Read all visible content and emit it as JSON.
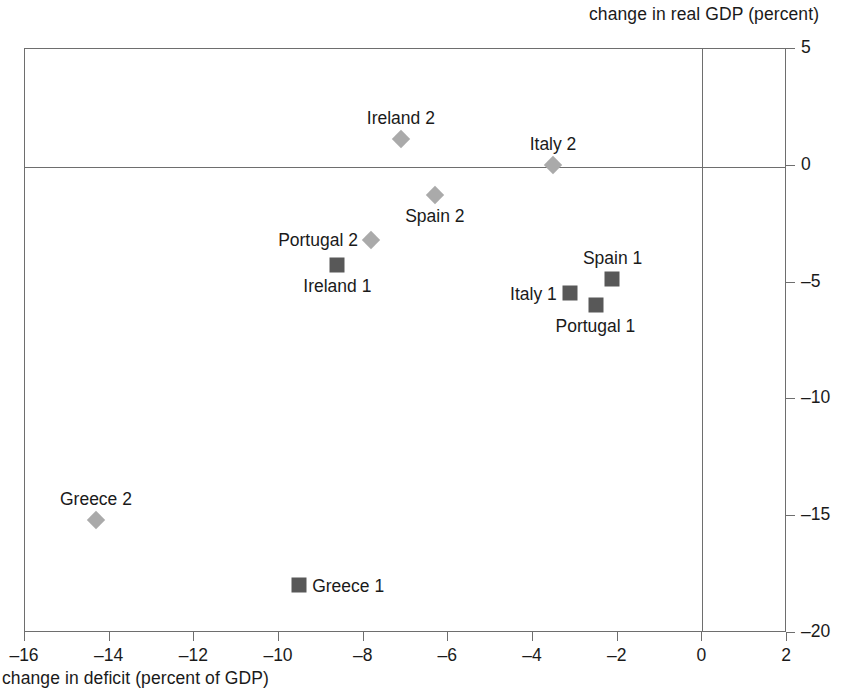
{
  "chart_data": {
    "type": "scatter",
    "title": "",
    "xlabel": "change in deficit (percent of GDP)",
    "ylabel": "change in real GDP (percent)",
    "xlim": [
      -16,
      2
    ],
    "ylim": [
      -20,
      5
    ],
    "xticks": [
      "-16",
      "-14",
      "-12",
      "-10",
      "-8",
      "-6",
      "-4",
      "-2",
      "0",
      "2"
    ],
    "xtick_values": [
      -16,
      -14,
      -12,
      -10,
      -8,
      -6,
      -4,
      -2,
      0,
      2
    ],
    "yticks": [
      "5",
      "0",
      "-5",
      "-10",
      "-15",
      "-20"
    ],
    "ytick_values": [
      5,
      0,
      -5,
      -10,
      -15,
      -20
    ],
    "grid": false,
    "legend": "none",
    "series": [
      {
        "name": "Period 1",
        "marker": "square",
        "color": "#585858",
        "points": [
          {
            "label": "Ireland 1",
            "x": -8.6,
            "y": -4.3,
            "label_pos": "below"
          },
          {
            "label": "Spain 1",
            "x": -2.1,
            "y": -4.9,
            "label_pos": "above"
          },
          {
            "label": "Italy 1",
            "x": -3.1,
            "y": -5.5,
            "label_pos": "left"
          },
          {
            "label": "Portugal 1",
            "x": -2.5,
            "y": -6.0,
            "label_pos": "below"
          },
          {
            "label": "Greece 1",
            "x": -9.5,
            "y": -18.0,
            "label_pos": "right"
          }
        ]
      },
      {
        "name": "Period 2",
        "marker": "diamond",
        "color": "#aaaaaa",
        "points": [
          {
            "label": "Ireland 2",
            "x": -7.1,
            "y": 1.1,
            "label_pos": "above"
          },
          {
            "label": "Italy 2",
            "x": -3.5,
            "y": 0.0,
            "label_pos": "above"
          },
          {
            "label": "Spain 2",
            "x": -6.3,
            "y": -1.3,
            "label_pos": "below"
          },
          {
            "label": "Portugal 2",
            "x": -7.8,
            "y": -3.2,
            "label_pos": "left"
          },
          {
            "label": "Greece 2",
            "x": -14.3,
            "y": -15.2,
            "label_pos": "above"
          }
        ]
      }
    ],
    "annotations": []
  },
  "axis": {
    "top_label": "change in real GDP (percent)",
    "bottom_label": "change in deficit (percent of GDP)"
  }
}
